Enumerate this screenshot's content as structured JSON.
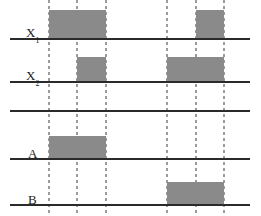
{
  "figure": {
    "type": "timing-diagram",
    "title": "",
    "width": 261,
    "height": 216,
    "background_color": "#ffffff",
    "pulse_fill_color": "#8a8a8a",
    "baseline_color": "#2a2a2a",
    "dashed_line_color": "#9b9b9b"
  },
  "time_markers": {
    "label": "dashed-transition-lines",
    "positions": [
      49,
      77,
      106,
      167,
      196,
      224
    ]
  },
  "signals": [
    {
      "id": "x1",
      "label": "X",
      "subscript": "1",
      "label_x": 26,
      "label_y": 26,
      "baseline_y": 38,
      "baseline_x1": 10,
      "baseline_x2": 250,
      "pulse_height": 28,
      "pulses": [
        {
          "start": 49,
          "end": 106
        },
        {
          "start": 196,
          "end": 224
        }
      ]
    },
    {
      "id": "x2",
      "label": "X",
      "subscript": "2",
      "label_x": 26,
      "label_y": 69,
      "baseline_y": 81,
      "baseline_x1": 10,
      "baseline_x2": 250,
      "pulse_height": 24,
      "pulses": [
        {
          "start": 77,
          "end": 106
        },
        {
          "start": 167,
          "end": 224
        }
      ]
    },
    {
      "id": "blank",
      "label": "",
      "subscript": "",
      "label_x": 26,
      "label_y": 100,
      "baseline_y": 110,
      "baseline_x1": 10,
      "baseline_x2": 250,
      "pulse_height": 0,
      "pulses": []
    },
    {
      "id": "a",
      "label": "A",
      "subscript": "",
      "label_x": 28,
      "label_y": 147,
      "baseline_y": 158,
      "baseline_x1": 10,
      "baseline_x2": 250,
      "pulse_height": 22,
      "pulses": [
        {
          "start": 49,
          "end": 106
        }
      ]
    },
    {
      "id": "b",
      "label": "B",
      "subscript": "",
      "label_x": 28,
      "label_y": 193,
      "baseline_y": 204,
      "baseline_x1": 10,
      "baseline_x2": 250,
      "pulse_height": 22,
      "pulses": [
        {
          "start": 167,
          "end": 224
        }
      ]
    }
  ],
  "chart_data": {
    "type": "line",
    "xlabel": "",
    "ylabel": "",
    "x": [
      49,
      77,
      106,
      167,
      196,
      224
    ],
    "series": [
      {
        "name": "X1",
        "values": [
          1,
          1,
          0,
          0,
          1,
          0
        ]
      },
      {
        "name": "X2",
        "values": [
          0,
          1,
          0,
          1,
          1,
          0
        ]
      },
      {
        "name": "A",
        "values": [
          1,
          1,
          0,
          0,
          0,
          0
        ]
      },
      {
        "name": "B",
        "values": [
          0,
          0,
          0,
          1,
          1,
          0
        ]
      }
    ]
  }
}
